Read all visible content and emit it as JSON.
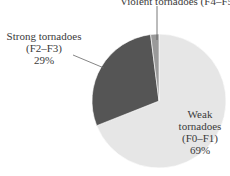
{
  "chart_data": {
    "type": "pie",
    "title": "",
    "categories": [
      "Weak tornadoes (F0–F1)",
      "Strong tornadoes (F2–F3)",
      "Violent tornadoes (F4–F5)"
    ],
    "values": [
      69,
      29,
      2
    ],
    "unit": "%",
    "colors": [
      "#e6e6e6",
      "#555555",
      "#9a9a9a"
    ],
    "start_angle": "top (12 o'clock), clockwise",
    "legend": "none (inline labels)"
  },
  "labels": {
    "violent": {
      "line1": "Violent tornadoes  (F4–F5)  2%"
    },
    "strong": {
      "line1": "Strong tornadoes",
      "line2": "(F2–F3)",
      "line3": "29%"
    },
    "weak": {
      "line1": "Weak",
      "line2": "tornadoes",
      "line3": "(F0–F1)",
      "line4": "69%"
    }
  }
}
